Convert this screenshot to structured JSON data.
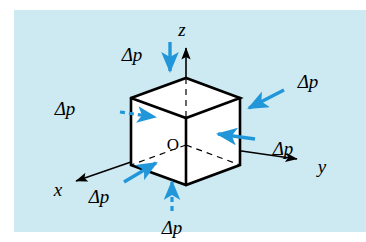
{
  "figure": {
    "title": "Pressure difference acting on a cubic fluid element",
    "background_color": "#cdeaf2",
    "page_color": "#ffffff",
    "edge_color": "#000000",
    "face_color": "#ffffff",
    "arrow_color": "#2196d9",
    "axis_color": "#000000",
    "origin_label": "O"
  },
  "axes": [
    {
      "id": "x",
      "label": "x",
      "label_x": 60,
      "label_y": 193,
      "direction": "down-left",
      "from": [
        186,
        143
      ],
      "to": [
        70,
        182
      ]
    },
    {
      "id": "y",
      "label": "y",
      "label_x": 320,
      "label_y": 168,
      "direction": "down-right",
      "from": [
        186,
        143
      ],
      "to": [
        303,
        160
      ]
    },
    {
      "id": "z",
      "label": "z",
      "label_x": 183,
      "label_y": 34,
      "direction": "up",
      "from": [
        186,
        143
      ],
      "to": [
        186,
        43
      ]
    }
  ],
  "cube": {
    "vertices": {
      "top_back": [
        186,
        78
      ],
      "top_left": [
        131,
        98
      ],
      "top_front": [
        186,
        118
      ],
      "top_right": [
        240,
        98
      ],
      "bottom_left": [
        131,
        165
      ],
      "bottom_front": [
        186,
        185
      ],
      "bottom_right": [
        240,
        165
      ],
      "bottom_back_hidden": [
        186,
        145
      ]
    },
    "hidden_edges": "dashed"
  },
  "pressure_arrows": [
    {
      "id": "top",
      "label": "Δp",
      "label_x": 131,
      "label_y": 55,
      "face": "top",
      "style": "solid",
      "direction": "down",
      "from": [
        170,
        42
      ],
      "to": [
        170,
        73
      ]
    },
    {
      "id": "bottom",
      "label": "Δp",
      "label_x": 171,
      "label_y": 230,
      "face": "bottom",
      "style": "dashed",
      "direction": "up",
      "from": [
        172,
        212
      ],
      "to": [
        172,
        180
      ]
    },
    {
      "id": "left",
      "label": "Δp",
      "label_x": 63,
      "label_y": 109,
      "face": "back-left (hidden)",
      "style": "dashed",
      "direction": "right",
      "from": [
        120,
        113
      ],
      "to": [
        160,
        118
      ]
    },
    {
      "id": "right",
      "label": "Δp",
      "label_x": 262,
      "label_y": 152,
      "face": "right",
      "style": "solid",
      "direction": "left",
      "from": [
        253,
        139
      ],
      "to": [
        214,
        134
      ]
    },
    {
      "id": "upper-right",
      "label": "Δp",
      "label_x": 290,
      "label_y": 84,
      "face": "right-top",
      "style": "solid",
      "direction": "down-left",
      "from": [
        281,
        93
      ],
      "to": [
        246,
        110
      ]
    },
    {
      "id": "lower-left",
      "label": "Δp",
      "label_x": 95,
      "label_y": 198,
      "face": "front-left",
      "style": "solid",
      "direction": "up-right",
      "from": [
        125,
        180
      ],
      "to": [
        158,
        162
      ]
    }
  ]
}
